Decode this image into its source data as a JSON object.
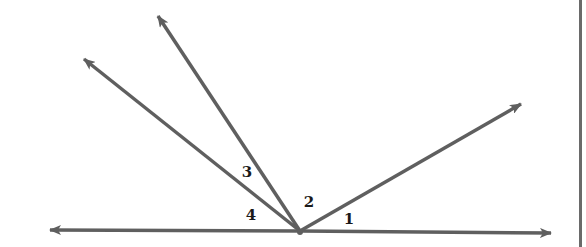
{
  "diagram": {
    "type": "angles-at-a-point-on-a-line",
    "colors": {
      "line": "#5f5f5f",
      "label": "#1a1a1a",
      "background": "#ffffff",
      "border": "#6a6a6a"
    },
    "vertex": {
      "x": 300,
      "y": 231
    },
    "line": {
      "left_tip": {
        "x": 50,
        "y": 230
      },
      "right_tip": {
        "x": 551,
        "y": 233
      }
    },
    "rays": [
      {
        "id": "ray-upper-right",
        "tip": {
          "x": 521,
          "y": 104
        }
      },
      {
        "id": "ray-steep-left",
        "tip": {
          "x": 158,
          "y": 16
        }
      },
      {
        "id": "ray-upper-left",
        "tip": {
          "x": 84,
          "y": 59
        }
      }
    ],
    "labels": [
      {
        "text": "1",
        "x": 349,
        "y": 219
      },
      {
        "text": "2",
        "x": 309,
        "y": 202
      },
      {
        "text": "3",
        "x": 247,
        "y": 172
      },
      {
        "text": "4",
        "x": 251,
        "y": 215
      }
    ]
  }
}
